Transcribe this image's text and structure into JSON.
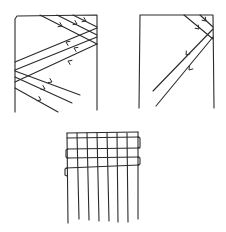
{
  "diagram": {
    "type": "hand-drawn weaving sketch",
    "stroke_color": "#2a2a2a",
    "background": "#ffffff",
    "panels": [
      {
        "id": "left-frame",
        "frame": [
          [
            15,
            112
          ],
          [
            15,
            19
          ],
          [
            17,
            16
          ],
          [
            97,
            15
          ],
          [
            97,
            110
          ]
        ],
        "threads": [
          [
            [
              40,
              15
            ],
            [
              97,
              44
            ]
          ],
          [
            [
              57,
              15
            ],
            [
              97,
              35
            ]
          ],
          [
            [
              73,
              15
            ],
            [
              97,
              27
            ]
          ],
          [
            [
              15,
              62
            ],
            [
              97,
              28
            ]
          ],
          [
            [
              15,
              70
            ],
            [
              97,
              37
            ]
          ],
          [
            [
              15,
              82
            ],
            [
              97,
              44
            ]
          ],
          [
            [
              15,
              71
            ],
            [
              80,
              95
            ]
          ],
          [
            [
              15,
              77
            ],
            [
              72,
              103
            ]
          ],
          [
            [
              15,
              88
            ],
            [
              58,
              112
            ]
          ]
        ],
        "arrows": [
          {
            "x": 62,
            "y": 26,
            "dir": "right"
          },
          {
            "x": 77,
            "y": 24,
            "dir": "right"
          },
          {
            "x": 86,
            "y": 21,
            "dir": "right"
          },
          {
            "x": 66,
            "y": 42,
            "dir": "left"
          },
          {
            "x": 74,
            "y": 48,
            "dir": "left"
          },
          {
            "x": 68,
            "y": 61,
            "dir": "left"
          },
          {
            "x": 52,
            "y": 82,
            "dir": "right"
          },
          {
            "x": 45,
            "y": 89,
            "dir": "right"
          },
          {
            "x": 41,
            "y": 100,
            "dir": "right"
          }
        ]
      },
      {
        "id": "right-frame",
        "frame": [
          [
            139,
            108
          ],
          [
            140,
            15
          ],
          [
            213,
            15
          ],
          [
            214,
            108
          ]
        ],
        "threads": [
          [
            [
              184,
              15
            ],
            [
              213,
              39
            ]
          ],
          [
            [
              200,
              15
            ],
            [
              213,
              27
            ]
          ],
          [
            [
              213,
              29
            ],
            [
              153,
              91
            ]
          ],
          [
            [
              213,
              37
            ],
            [
              156,
              106
            ]
          ]
        ],
        "arrows": [
          {
            "x": 206,
            "y": 21,
            "dir": "down-right"
          },
          {
            "x": 199,
            "y": 29,
            "dir": "down-right"
          },
          {
            "x": 186,
            "y": 55,
            "dir": "down-left"
          },
          {
            "x": 189,
            "y": 70,
            "dir": "down-left"
          }
        ]
      },
      {
        "id": "bottom-grid",
        "weft": [
          [
            [
              67,
              133
            ],
            [
              138,
              132
            ]
          ],
          [
            [
              67,
              138
            ],
            [
              139,
              137
            ]
          ],
          [
            [
              68,
              149
            ],
            [
              140,
              148
            ]
          ],
          [
            [
              67,
              158
            ],
            [
              139,
              157
            ]
          ],
          [
            [
              66,
              168
            ],
            [
              139,
              165
            ]
          ]
        ],
        "weft_loops": [
          {
            "side": "right",
            "y1": 137,
            "y2": 148,
            "x": 140
          },
          {
            "side": "left",
            "y1": 149,
            "y2": 158,
            "x": 66
          },
          {
            "side": "right",
            "y1": 157,
            "y2": 165,
            "x": 140
          },
          {
            "side": "left",
            "y1": 168,
            "y2": 176,
            "x": 65
          }
        ],
        "warp": [
          [
            [
              67,
              133
            ],
            [
              68,
              223
            ]
          ],
          [
            [
              77,
              133
            ],
            [
              79,
              219
            ]
          ],
          [
            [
              87,
              133
            ],
            [
              89,
              220
            ]
          ],
          [
            [
              97,
              133
            ],
            [
              99,
              221
            ]
          ],
          [
            [
              107,
              133
            ],
            [
              109,
              221
            ]
          ],
          [
            [
              117,
              133
            ],
            [
              118,
              222
            ]
          ],
          [
            [
              127,
              133
            ],
            [
              128,
              222
            ]
          ],
          [
            [
              138,
              132
            ],
            [
              138,
              219
            ]
          ]
        ]
      }
    ]
  }
}
